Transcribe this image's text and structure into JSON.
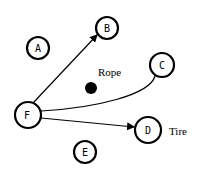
{
  "diagram": {
    "nodes": [
      {
        "id": "A",
        "label": "A",
        "cx": 38,
        "cy": 48,
        "r": 11
      },
      {
        "id": "B",
        "label": "B",
        "cx": 107,
        "cy": 28,
        "r": 11
      },
      {
        "id": "C",
        "label": "C",
        "cx": 162,
        "cy": 65,
        "r": 12
      },
      {
        "id": "D",
        "label": "D",
        "cx": 148,
        "cy": 130,
        "r": 13
      },
      {
        "id": "E",
        "label": "E",
        "cx": 85,
        "cy": 152,
        "r": 11
      },
      {
        "id": "F",
        "label": "F",
        "cx": 28,
        "cy": 115,
        "r": 13
      }
    ],
    "edges": [
      {
        "from": "F",
        "to": "B",
        "arrow": true
      },
      {
        "from": "F",
        "to": "C",
        "arrow": false,
        "curved": true
      },
      {
        "from": "F",
        "to": "D",
        "arrow": true
      }
    ],
    "objects": [
      {
        "id": "rope",
        "label": "Rope",
        "type": "filled-dot"
      },
      {
        "id": "tire",
        "label": "Tire",
        "attached_to": "D"
      }
    ]
  }
}
